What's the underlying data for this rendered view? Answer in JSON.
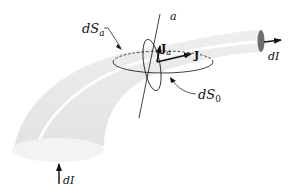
{
  "diagram": {
    "type": "current-tube-surface-elements",
    "labels": {
      "dS_a": {
        "main": "dS",
        "sub": "a"
      },
      "dS_0": {
        "main": "dS",
        "sub": "0"
      },
      "axis_a": "a",
      "J_a": {
        "main": "J",
        "sub": "a"
      },
      "J": "J",
      "dI_right": "dI",
      "dI_bottom": "dI"
    },
    "colors": {
      "tube_fill": "#e6e6e6",
      "tube_highlight": "#ffffff",
      "end_cap": "#6e6e6e",
      "ink": "#111111"
    }
  }
}
